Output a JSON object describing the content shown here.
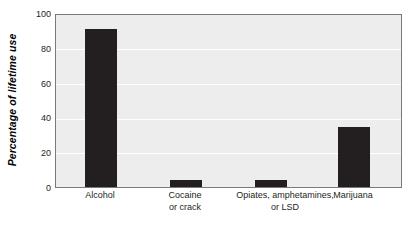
{
  "chart_data": {
    "type": "bar",
    "title": "",
    "subtitle": "",
    "xlabel": "",
    "ylabel": "Percentage of lifetime use",
    "categories": [
      "Alcohol",
      "Cocaine or crack",
      "Opiates, amphetamines, or LSD",
      "Marijuana"
    ],
    "category_lines": [
      [
        "Alcohol"
      ],
      [
        "Cocaine",
        "or crack"
      ],
      [
        "Opiates, amphetamines,",
        "or LSD"
      ],
      [
        "Marijuana"
      ]
    ],
    "values": [
      92,
      4,
      4,
      35
    ],
    "ylim": [
      0,
      100
    ],
    "yticks": [
      100,
      80,
      60,
      40,
      20,
      0
    ],
    "ytick_labels": [
      "100",
      "80",
      "60",
      "40",
      "20",
      "0"
    ],
    "grid": true,
    "grid_axis": "y",
    "legend": null,
    "bar_color": "#231f20",
    "plot_background": "#ededed",
    "gridline_color": "#ffffff",
    "frame_color": "#7a7a7a",
    "figure_background": "#ffffff"
  },
  "axis": {
    "y_title": "Percentage of lifetime use"
  }
}
